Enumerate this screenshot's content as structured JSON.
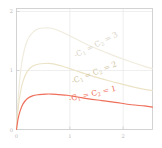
{
  "chart_data": {
    "type": "line",
    "title": "",
    "xlabel": "",
    "ylabel": "",
    "xlim": [
      0,
      2.55
    ],
    "ylim": [
      0,
      2.05
    ],
    "grid": true,
    "legend_position": "inline-annotations",
    "xticks": [
      "0",
      "1",
      "2"
    ],
    "xtick_values": [
      0,
      1,
      2
    ],
    "yticks": [
      "0",
      "1",
      "2"
    ],
    "ytick_values": [
      0,
      1,
      2
    ],
    "series": [
      {
        "name": "-C_1 = C_2 = 3",
        "color": "#f0ebdd",
        "peak_x": 0.62,
        "peak_y": 1.72,
        "x": [
          0,
          0.03,
          0.07,
          0.12,
          0.2,
          0.3,
          0.42,
          0.55,
          0.62,
          0.75,
          0.9,
          1.1,
          1.3,
          1.55,
          1.8,
          2.1,
          2.4,
          2.55
        ],
        "values": [
          0,
          0.52,
          0.93,
          1.24,
          1.5,
          1.64,
          1.71,
          1.72,
          1.72,
          1.69,
          1.63,
          1.54,
          1.45,
          1.35,
          1.26,
          1.16,
          1.07,
          1.03
        ]
      },
      {
        "name": "-C_1 = C_2 = 2",
        "color": "#ece3c6",
        "peak_x": 0.6,
        "peak_y": 1.12,
        "x": [
          0,
          0.03,
          0.07,
          0.12,
          0.2,
          0.3,
          0.42,
          0.55,
          0.6,
          0.75,
          0.9,
          1.1,
          1.3,
          1.55,
          1.8,
          2.1,
          2.4,
          2.55
        ],
        "values": [
          0,
          0.34,
          0.61,
          0.81,
          0.98,
          1.07,
          1.11,
          1.12,
          1.12,
          1.1,
          1.06,
          1.0,
          0.94,
          0.87,
          0.81,
          0.74,
          0.68,
          0.66
        ]
      },
      {
        "name": "-C_1 = C_2 = 1",
        "color": "#ef6f5a",
        "peak_x": 0.66,
        "peak_y": 0.6,
        "x": [
          0,
          0.03,
          0.07,
          0.12,
          0.2,
          0.3,
          0.42,
          0.55,
          0.66,
          0.8,
          0.95,
          1.15,
          1.35,
          1.6,
          1.85,
          2.15,
          2.4,
          2.55
        ],
        "values": [
          0,
          0.18,
          0.32,
          0.43,
          0.52,
          0.57,
          0.59,
          0.6,
          0.6,
          0.59,
          0.58,
          0.55,
          0.52,
          0.49,
          0.46,
          0.42,
          0.4,
          0.38
        ]
      }
    ],
    "annotations": [
      {
        "name": "label-c3",
        "text": "-C",
        "sub1": "1",
        "mid": " = C",
        "sub2": "2",
        "tail": " = 3",
        "color": "#d8d2c4",
        "x": 97,
        "y": 47,
        "rotation": -27
      },
      {
        "name": "label-c2",
        "text": "-C",
        "sub1": "1",
        "mid": " = C",
        "sub2": "2",
        "tail": " = 2",
        "color": "#cfc49c",
        "x": 95,
        "y": 75,
        "rotation": -22
      },
      {
        "name": "label-c1",
        "text": "-C",
        "sub1": "1",
        "mid": " = C",
        "sub2": "2",
        "tail": " = 1",
        "color": "#ef6f5a",
        "x": 93,
        "y": 96,
        "rotation": -13
      }
    ],
    "colors": {
      "frame": "#cfcfcf",
      "grid": "#e8e8e8",
      "tick_text": "#b9b9b9",
      "background": "#ffffff"
    }
  }
}
